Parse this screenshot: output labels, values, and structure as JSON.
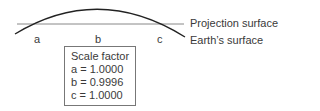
{
  "diagram": {
    "labels": {
      "projection_surface": "Projection surface",
      "earths_surface": "Earth’s surface",
      "point_a": "a",
      "point_b": "b",
      "point_c": "c"
    },
    "scale_box": {
      "title": "Scale factor",
      "rows": [
        "a = 1.0000",
        "b = 0.9996",
        "c = 1.0000"
      ]
    },
    "colors": {
      "line": "#888888",
      "curve": "#222222",
      "text": "#3a3a3a"
    }
  }
}
